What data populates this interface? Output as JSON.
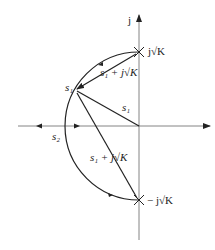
{
  "diagram": {
    "axes": {
      "imag_label": "j",
      "real_label": ""
    },
    "labels": {
      "top_pole": "j√K",
      "bottom_pole": "− j√K",
      "s1_point": "s₁",
      "s1_vector": "s₁",
      "s2_point": "s₂",
      "upper_vector": "s₁ + j√K",
      "lower_vector": "s₁ + j√K"
    },
    "colors": {
      "stroke": "#222222",
      "axis": "#555555",
      "background": "#ffffff"
    }
  }
}
